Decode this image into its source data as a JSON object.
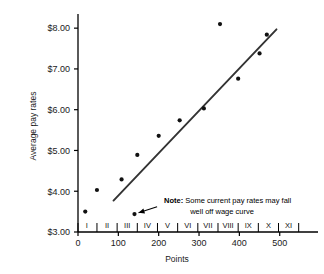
{
  "chart_data": {
    "type": "scatter",
    "title": "",
    "xlabel": "Points",
    "ylabel": "Average pay rates",
    "xlim": [
      0,
      580
    ],
    "ylim": [
      3.0,
      8.2
    ],
    "grid": false,
    "legend": null,
    "x_ticks": [
      "0",
      "100",
      "200",
      "300",
      "400",
      "500"
    ],
    "x_tick_values": [
      0,
      100,
      200,
      300,
      400,
      500
    ],
    "y_ticks": [
      "$3.00",
      "$4.00",
      "$5.00",
      "$6.00",
      "$7.00",
      "$8.00"
    ],
    "y_tick_values": [
      3.0,
      4.0,
      5.0,
      6.0,
      7.0,
      8.0
    ],
    "grade_labels": [
      "I",
      "II",
      "III",
      "IV",
      "V",
      "VI",
      "VII",
      "VIII",
      "IX",
      "X",
      "XI"
    ],
    "grade_centers": [
      22,
      72,
      122,
      172,
      222,
      272,
      322,
      372,
      422,
      472,
      522
    ],
    "grade_boundaries": [
      0,
      47,
      97,
      147,
      197,
      247,
      297,
      347,
      397,
      447,
      497,
      547
    ],
    "points": [
      {
        "x": 18,
        "y": 3.5
      },
      {
        "x": 47,
        "y": 4.03
      },
      {
        "x": 108,
        "y": 4.29
      },
      {
        "x": 140,
        "y": 3.44
      },
      {
        "x": 147,
        "y": 4.89
      },
      {
        "x": 200,
        "y": 5.36
      },
      {
        "x": 252,
        "y": 5.74
      },
      {
        "x": 312,
        "y": 6.03
      },
      {
        "x": 352,
        "y": 8.1
      },
      {
        "x": 397,
        "y": 6.76
      },
      {
        "x": 450,
        "y": 7.38
      },
      {
        "x": 468,
        "y": 7.84
      }
    ],
    "trendline": {
      "name": "wage curve",
      "x_start": 88,
      "y_start": 3.77,
      "x_end": 492,
      "y_end": 7.97
    },
    "annotation": {
      "label_bold": "Note:",
      "line1": "Some current pay rates may fall",
      "line2": "well off wage curve",
      "arrow_from_x": 196,
      "arrow_from_y": 3.62,
      "arrow_to_x": 150,
      "arrow_to_y": 3.47
    },
    "colors": {
      "axis": "#000000",
      "point": "#111111",
      "line": "#333333",
      "text": "#1a1a1a",
      "background": "#ffffff"
    }
  }
}
